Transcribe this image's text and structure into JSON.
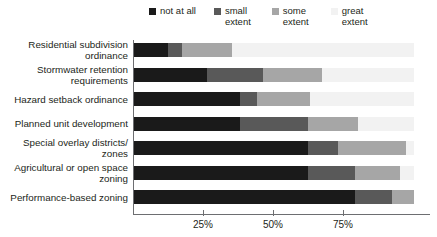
{
  "chart_data": {
    "type": "bar",
    "subtype": "stacked-horizontal-100",
    "title": "",
    "xlabel": "",
    "ylabel": "",
    "xlim": [
      0,
      100
    ],
    "grid": false,
    "legend_position": "top",
    "categories": [
      "Residential subdivision\nordinance",
      "Stormwater retention\nrequirements",
      "Hazard setback ordinance",
      "Planned unit development",
      "Special overlay districts/\nzones",
      "Agricultural or open space\nzoning",
      "Performance-based zoning"
    ],
    "series": [
      {
        "name": "not at all",
        "color": "#1a1a1a",
        "values": [
          12,
          26,
          38,
          38,
          62,
          62,
          79
        ]
      },
      {
        "name": "small extent",
        "color": "#595959",
        "values": [
          5,
          20,
          6,
          24,
          11,
          17,
          13
        ]
      },
      {
        "name": "some extent",
        "color": "#a6a6a6",
        "values": [
          18,
          21,
          19,
          18,
          24,
          16,
          8
        ]
      },
      {
        "name": "great extent",
        "color": "#f2f2f2",
        "values": [
          65,
          33,
          37,
          20,
          3,
          5,
          0
        ]
      }
    ],
    "xticks": [
      25,
      50,
      75
    ],
    "xticklabels": [
      "25%",
      "50%",
      "75%"
    ]
  },
  "legend": {
    "items": [
      {
        "label": "not at all",
        "color": "#1a1a1a",
        "name": "not-at-all"
      },
      {
        "label": "small\nextent",
        "color": "#595959",
        "name": "small-extent"
      },
      {
        "label": "some\nextent",
        "color": "#a6a6a6",
        "name": "some-extent"
      },
      {
        "label": "great\nextent",
        "color": "#f2f2f2",
        "name": "great-extent"
      }
    ]
  }
}
